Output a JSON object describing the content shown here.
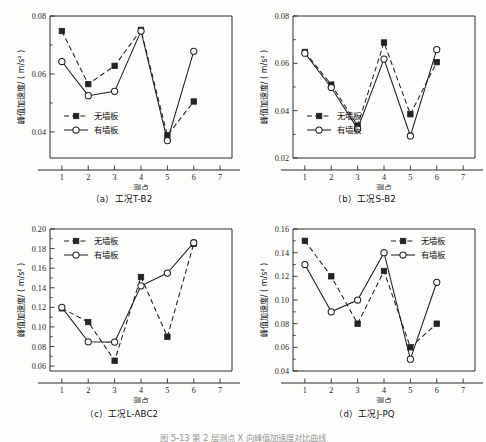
{
  "figure": {
    "caption_partial": "图 5-13   第 2 层测点 X 向峰值加速度对比曲线",
    "axis_labels": {
      "x": "测点",
      "y": "峰值加速度/ ( m/s² )"
    },
    "legend": [
      {
        "key": "no_panel",
        "label": "无墙板",
        "marker": "filled-square",
        "line": "dashed"
      },
      {
        "key": "with_panel",
        "label": "有墙板",
        "marker": "open-circle",
        "line": "solid"
      }
    ]
  },
  "chart_data": [
    {
      "id": "a",
      "type": "line",
      "title": "（a）工况T-B2",
      "caption_index": "（a）",
      "condition": "工况T-B2",
      "xlabel": "测点",
      "ylabel": "峰值加速度/ ( m/s² )",
      "x": [
        1,
        2,
        3,
        4,
        5,
        6,
        7
      ],
      "categories": [
        "1",
        "2",
        "3",
        "4",
        "5",
        "6",
        "7"
      ],
      "xlim": [
        0.55,
        7.45
      ],
      "ylim": [
        0.031,
        0.08
      ],
      "yticks": [
        0.04,
        0.06,
        0.08
      ],
      "ytick_labels": [
        "0.04",
        "0.06",
        "0.08"
      ],
      "grid": false,
      "legend_position": "lower-left",
      "series": [
        {
          "name": "无墙板",
          "values": [
            0.0748,
            0.0565,
            0.0628,
            0.0752,
            0.0388,
            0.0505,
            null
          ]
        },
        {
          "name": "有墙板",
          "values": [
            0.0643,
            0.0525,
            0.054,
            0.0748,
            0.037,
            0.0678,
            null
          ]
        }
      ]
    },
    {
      "id": "b",
      "type": "line",
      "title": "（b）工况S-B2",
      "caption_index": "（b）",
      "condition": "工况S-B2",
      "xlabel": "测点",
      "ylabel": "峰值加速度/ ( m/s² )",
      "x": [
        1,
        2,
        3,
        4,
        5,
        6,
        7
      ],
      "categories": [
        "1",
        "2",
        "3",
        "4",
        "5",
        "6",
        "7"
      ],
      "xlim": [
        0.55,
        7.45
      ],
      "ylim": [
        0.02,
        0.08
      ],
      "yticks": [
        0.02,
        0.04,
        0.06,
        0.08
      ],
      "ytick_labels": [
        "0.02",
        "0.04",
        "0.06",
        "0.08"
      ],
      "grid": false,
      "legend_position": "lower-left",
      "series": [
        {
          "name": "无墙板",
          "values": [
            0.0648,
            0.051,
            0.0337,
            0.0688,
            0.0385,
            0.0605,
            null
          ]
        },
        {
          "name": "有墙板",
          "values": [
            0.0643,
            0.0498,
            0.0323,
            0.0618,
            0.0293,
            0.0658,
            null
          ]
        }
      ]
    },
    {
      "id": "c",
      "type": "line",
      "title": "（c）工况L-ABC2",
      "caption_index": "（c）",
      "condition": "工况L-ABC2",
      "xlabel": "测点",
      "ylabel": "峰值加速度/ ( m/s² )",
      "x": [
        1,
        2,
        3,
        4,
        5,
        6,
        7
      ],
      "categories": [
        "1",
        "2",
        "3",
        "4",
        "5",
        "6",
        "7"
      ],
      "xlim": [
        0.55,
        7.45
      ],
      "ylim": [
        0.055,
        0.2
      ],
      "yticks": [
        0.06,
        0.08,
        0.1,
        0.12,
        0.14,
        0.16,
        0.18,
        0.2
      ],
      "ytick_labels": [
        "0.06",
        "0.08",
        "0.10",
        "0.12",
        "0.14",
        "0.16",
        "0.18",
        "0.20"
      ],
      "grid": false,
      "legend_position": "upper-left",
      "series": [
        {
          "name": "无墙板",
          "values": [
            0.119,
            0.105,
            0.0655,
            0.151,
            0.09,
            0.185,
            null
          ]
        },
        {
          "name": "有墙板",
          "values": [
            0.12,
            0.0848,
            0.0845,
            0.142,
            0.155,
            0.186,
            null
          ]
        }
      ]
    },
    {
      "id": "d",
      "type": "line",
      "title": "（d）工况J-PQ",
      "caption_index": "（d）",
      "condition": "工况J-PQ",
      "xlabel": "测点",
      "ylabel": "峰值加速度/ ( m/s² )",
      "x": [
        1,
        2,
        3,
        4,
        5,
        6,
        7
      ],
      "categories": [
        "1",
        "2",
        "3",
        "4",
        "5",
        "6",
        "7"
      ],
      "xlim": [
        0.55,
        7.45
      ],
      "ylim": [
        0.04,
        0.16
      ],
      "yticks": [
        0.04,
        0.06,
        0.08,
        0.1,
        0.12,
        0.14,
        0.16
      ],
      "ytick_labels": [
        "0.04",
        "0.06",
        "0.08",
        "0.10",
        "0.12",
        "0.14",
        "0.16"
      ],
      "grid": false,
      "legend_position": "upper-right",
      "series": [
        {
          "name": "无墙板",
          "values": [
            0.15,
            0.12,
            0.08,
            0.1245,
            0.06,
            0.08,
            null
          ]
        },
        {
          "name": "有墙板",
          "values": [
            0.13,
            0.09,
            0.1,
            0.14,
            0.05,
            0.115,
            null
          ]
        }
      ]
    }
  ]
}
